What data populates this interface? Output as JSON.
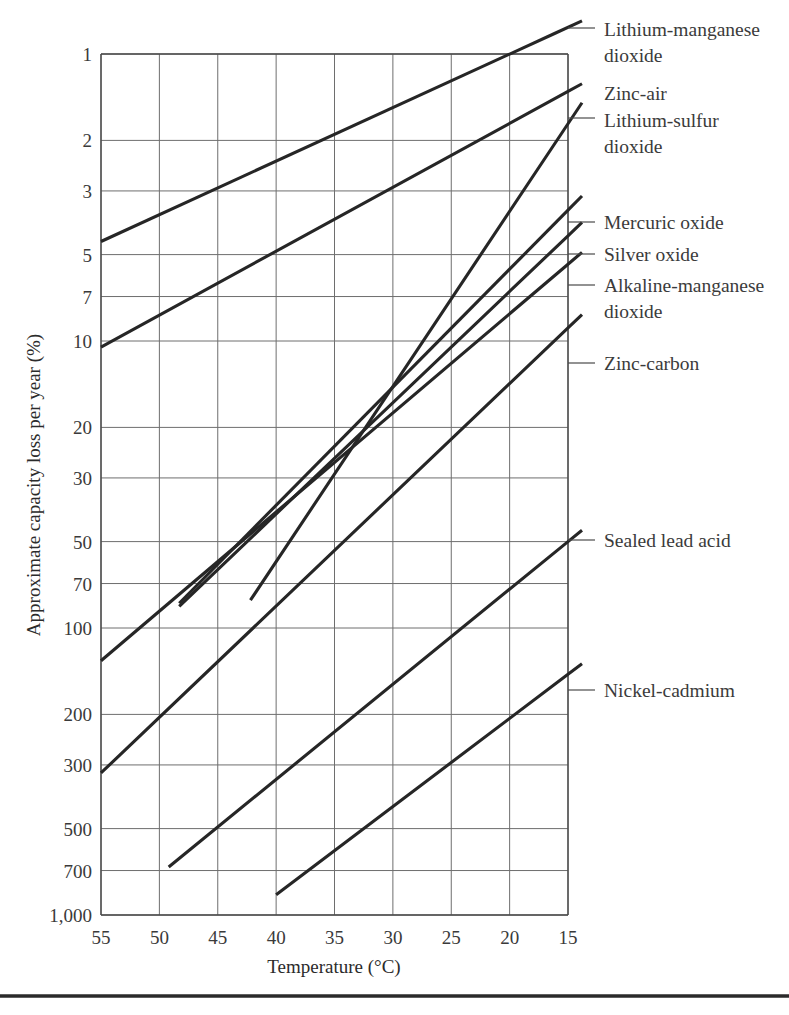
{
  "figure": {
    "bottom_rule": true
  },
  "chart_data": {
    "type": "line",
    "title": "",
    "xlabel": "Temperature (°C)",
    "ylabel": "Approximate capacity loss per year (%)",
    "x_ticks": [
      55,
      50,
      45,
      40,
      35,
      30,
      25,
      20,
      15
    ],
    "x_tick_labels": [
      "55",
      "50",
      "45",
      "40",
      "35",
      "30",
      "25",
      "20",
      "15"
    ],
    "xlim": [
      55,
      15
    ],
    "x_reversed": true,
    "y_ticks": [
      1,
      2,
      3,
      5,
      7,
      10,
      20,
      30,
      50,
      70,
      100,
      200,
      300,
      500,
      700,
      1000
    ],
    "y_tick_labels": [
      "1",
      "2",
      "3",
      "5",
      "7",
      "10",
      "20",
      "30",
      "50",
      "70",
      "100",
      "200",
      "300",
      "500",
      "700",
      "1,000"
    ],
    "ylim": [
      1,
      1000
    ],
    "y_scale": "log",
    "y_reversed": true,
    "grid": true,
    "legend_position": "right-inline-labels",
    "series": [
      {
        "name": "Lithium-manganese dioxide",
        "label": "Lithium-manganese dioxide",
        "label_lines": [
          "Lithium-manganese",
          "dioxide"
        ],
        "points": [
          [
            55,
            4.5
          ],
          [
            16.2,
            0.85
          ]
        ]
      },
      {
        "name": "Zinc-air",
        "label": "Zinc-air",
        "label_lines": [
          "Zinc-air"
        ],
        "points": [
          [
            55,
            10.5
          ],
          [
            15,
            1.35
          ]
        ]
      },
      {
        "name": "Lithium-sulfur dioxide",
        "label": "Lithium-sulfur dioxide",
        "label_lines": [
          "Lithium-sulfur",
          "dioxide"
        ],
        "points": [
          [
            42.2,
            80
          ],
          [
            15,
            1.75
          ]
        ]
      },
      {
        "name": "Mercuric oxide",
        "label": "Mercuric oxide",
        "label_lines": [
          "Mercuric oxide"
        ],
        "points": [
          [
            48.3,
            82
          ],
          [
            15,
            3.5
          ]
        ]
      },
      {
        "name": "Silver oxide",
        "label": "Silver oxide",
        "label_lines": [
          "Silver oxide"
        ],
        "points": [
          [
            48.3,
            84
          ],
          [
            15,
            4.3
          ]
        ]
      },
      {
        "name": "Alkaline-manganese dioxide",
        "label": "Alkaline-manganese dioxide",
        "label_lines": [
          "Alkaline-manganese",
          "dioxide"
        ],
        "points": [
          [
            55,
            130
          ],
          [
            15,
            5.4
          ]
        ]
      },
      {
        "name": "Zinc-carbon",
        "label": "Zinc-carbon",
        "label_lines": [
          "Zinc-carbon"
        ],
        "points": [
          [
            55,
            320
          ],
          [
            15,
            9.0
          ]
        ]
      },
      {
        "name": "Sealed lead acid",
        "label": "Sealed lead acid",
        "label_lines": [
          "Sealed lead acid"
        ],
        "points": [
          [
            49.2,
            680
          ],
          [
            15,
            50
          ]
        ]
      },
      {
        "name": "Nickel-cadmium",
        "label": "Nickel-cadmium",
        "label_lines": [
          "Nickel-cadmium"
        ],
        "points": [
          [
            40.0,
            850
          ],
          [
            15,
            145
          ]
        ]
      }
    ]
  }
}
